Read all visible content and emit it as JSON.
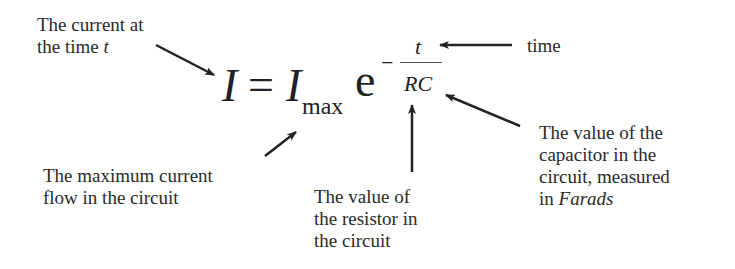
{
  "diagram": {
    "formula": {
      "lhs": "I",
      "equals": "=",
      "rhs_base": "I",
      "rhs_subscript": "max",
      "exp_base": "e",
      "exp_sign": "−",
      "exp_numerator": "t",
      "exp_denominator": "RC"
    },
    "annotations": {
      "current_at_time": {
        "line1": "The current at",
        "line2_prefix": "the time ",
        "line2_var": "t"
      },
      "time": {
        "text": "time"
      },
      "max_current": {
        "line1": "The maximum current",
        "line2": "flow in the circuit"
      },
      "resistor": {
        "line1": "The value of",
        "line2": "the resistor in",
        "line3": "the circuit"
      },
      "capacitor": {
        "line1": "The value of the",
        "line2": "capacitor in the",
        "line3": "circuit, measured",
        "line4_prefix": "in ",
        "line4_unit": "Farads"
      }
    },
    "colors": {
      "text": "#2a2a2a",
      "arrow": "#222222",
      "background": "#ffffff"
    }
  }
}
